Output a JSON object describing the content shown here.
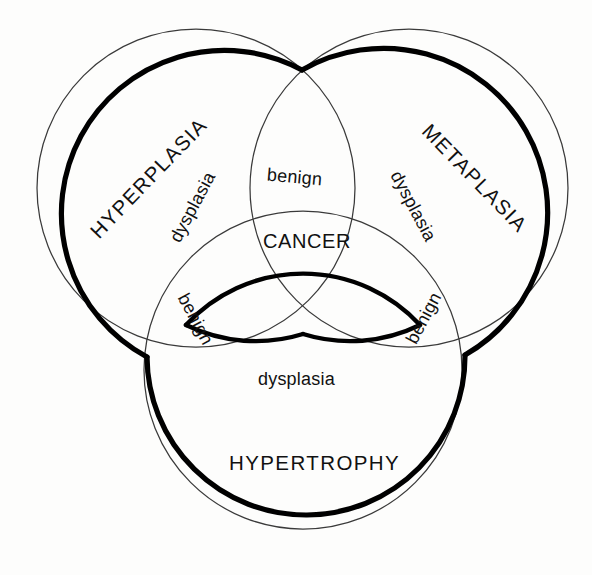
{
  "figure": {
    "type": "venn-diagram",
    "sets": 3,
    "background_color": "#fdfdfc",
    "outline_color": "#3a3a3a",
    "emphasis_color": "#000000"
  },
  "labels": {
    "set_left": "HYPERPLASIA",
    "set_right": "METAPLASIA",
    "set_bottom": "HYPERTROPHY",
    "center": "CANCER",
    "dysplasia_left": "dysplasia",
    "dysplasia_right": "dysplasia",
    "dysplasia_bottom": "dysplasia",
    "benign_top": "benign",
    "benign_left": "benign",
    "benign_right": "benign"
  },
  "chart_data": {
    "type": "diagram",
    "title": "",
    "regions": [
      {
        "name": "HYPERPLASIA",
        "kind": "set",
        "membership": [
          "hyperplasia"
        ]
      },
      {
        "name": "METAPLASIA",
        "kind": "set",
        "membership": [
          "metaplasia"
        ]
      },
      {
        "name": "HYPERTROPHY",
        "kind": "set",
        "membership": [
          "hypertrophy"
        ]
      },
      {
        "name": "benign",
        "kind": "pairwise-overlap",
        "membership": [
          "hyperplasia",
          "metaplasia"
        ]
      },
      {
        "name": "benign",
        "kind": "pairwise-overlap",
        "membership": [
          "hyperplasia",
          "hypertrophy"
        ]
      },
      {
        "name": "benign",
        "kind": "pairwise-overlap",
        "membership": [
          "metaplasia",
          "hypertrophy"
        ]
      },
      {
        "name": "dysplasia",
        "kind": "boundary-band",
        "membership": [
          "hyperplasia",
          "metaplasia"
        ]
      },
      {
        "name": "dysplasia",
        "kind": "boundary-band",
        "membership": [
          "metaplasia",
          "hypertrophy"
        ]
      },
      {
        "name": "dysplasia",
        "kind": "boundary-band",
        "membership": [
          "hyperplasia",
          "hypertrophy"
        ]
      },
      {
        "name": "CANCER",
        "kind": "triple-overlap",
        "membership": [
          "hyperplasia",
          "metaplasia",
          "hypertrophy"
        ]
      }
    ],
    "legend": [],
    "annotations": [
      "CANCER occupies the central triple-intersection bounded by bold arcs"
    ]
  },
  "geometry": {
    "circles": [
      {
        "id": "hyperplasia",
        "cx": 196,
        "cy": 188,
        "r": 159
      },
      {
        "id": "metaplasia",
        "cx": 409,
        "cy": 188,
        "r": 159
      },
      {
        "id": "hypertrophy",
        "cx": 303,
        "cy": 370,
        "r": 159
      }
    ],
    "vertices": {
      "top": [
        302,
        70
      ],
      "left": [
        147,
        357
      ],
      "right": [
        465,
        355
      ],
      "center": [
        303,
        333
      ]
    }
  }
}
